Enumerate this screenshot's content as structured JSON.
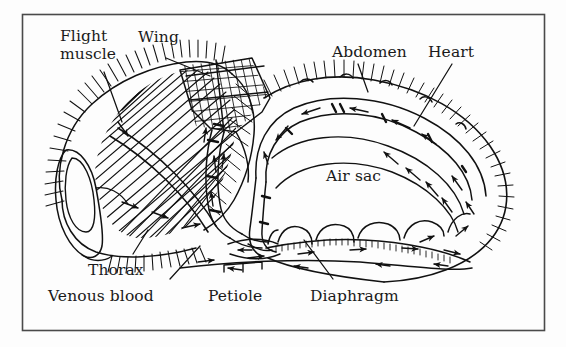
{
  "figure": {
    "title_visible": false,
    "frame": {
      "border_color": "#4a4a4a",
      "background": "#fdfdfd",
      "x": 22,
      "y": 14,
      "width": 523,
      "height": 317
    },
    "ink_color": "#111111",
    "labels": [
      {
        "id": "flight-muscle",
        "line1": "Flight",
        "line2": "muscle",
        "x": 60,
        "y": 30
      },
      {
        "id": "wing",
        "line1": "Wing",
        "line2": "",
        "x": 140,
        "y": 30
      },
      {
        "id": "abdomen",
        "line1": "Abdomen",
        "line2": "",
        "x": 332,
        "y": 45
      },
      {
        "id": "heart",
        "line1": "Heart",
        "line2": "",
        "x": 428,
        "y": 45
      },
      {
        "id": "air-sac",
        "line1": "Air sac",
        "line2": "",
        "x": 325,
        "y": 168
      },
      {
        "id": "thorax",
        "line1": "Thorax",
        "line2": "",
        "x": 88,
        "y": 262
      },
      {
        "id": "venous-blood",
        "line1": "Venous blood",
        "line2": "",
        "x": 48,
        "y": 288
      },
      {
        "id": "petiole",
        "line1": "Petiole",
        "line2": "",
        "x": 208,
        "y": 288
      },
      {
        "id": "diaphragm",
        "line1": "Diaphragm",
        "line2": "",
        "x": 310,
        "y": 288
      }
    ],
    "leader_lines": [
      {
        "id": "flight-muscle-leader",
        "from": [
          104,
          72
        ],
        "to": [
          122,
          120
        ]
      },
      {
        "id": "wing-leader",
        "from": [
          166,
          58
        ],
        "to": [
          200,
          72
        ]
      },
      {
        "id": "abdomen-leader",
        "from": [
          358,
          64
        ],
        "to": [
          368,
          90
        ]
      },
      {
        "id": "heart-leader",
        "from": [
          452,
          64
        ],
        "to": [
          420,
          122
        ]
      },
      {
        "id": "thorax-leader",
        "from": [
          133,
          255
        ],
        "to": [
          145,
          232
        ]
      },
      {
        "id": "venous-blood-leader",
        "from": [
          170,
          280
        ],
        "to": [
          198,
          248
        ]
      },
      {
        "id": "petiole-bracket",
        "from": [
          226,
          280
        ],
        "to": [
          262,
          268
        ]
      },
      {
        "id": "diaphragm-leader",
        "from": [
          333,
          280
        ],
        "to": [
          308,
          238
        ]
      }
    ],
    "anatomy_parts": [
      "head",
      "compound-eye",
      "thorax",
      "flight-muscle",
      "wing-base",
      "petiole",
      "abdomen",
      "heart",
      "dorsal-vessel",
      "ventral-diaphragm",
      "air-sac",
      "setae-hairs",
      "hemolymph-flow-arrows"
    ],
    "flow_arrows_count": 28
  }
}
